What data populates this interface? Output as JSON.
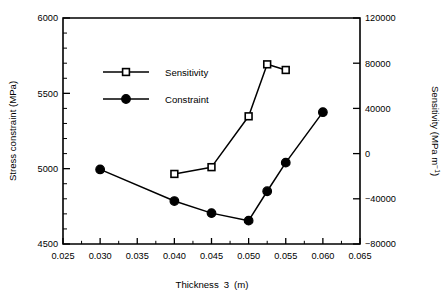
{
  "chart_data": {
    "type": "line",
    "title": "",
    "xlabel": "Thickness  3  (m)",
    "ylabel": "Stress constraint (MPa)",
    "y2label": "Sensitivity (MPa m⁻¹)",
    "xlim": [
      0.025,
      0.065
    ],
    "ylim": [
      4500,
      6000
    ],
    "y2lim": [
      -80000,
      120000
    ],
    "grid": false,
    "legend_position": "upper-left-inside",
    "xticks": [
      "0.025",
      "0.030",
      "0.035",
      "0.040",
      "0.045",
      "0.050",
      "0.055",
      "0.060",
      "0.065"
    ],
    "xtick_values": [
      0.025,
      0.03,
      0.035,
      0.04,
      0.045,
      0.05,
      0.055,
      0.06,
      0.065
    ],
    "yticks": [
      "4500",
      "5000",
      "5500",
      "6000"
    ],
    "ytick_values": [
      4500,
      5000,
      5500,
      6000
    ],
    "y2ticks": [
      "-80000",
      "-40000",
      "0",
      "40000",
      "80000",
      "120000"
    ],
    "y2tick_values": [
      -80000,
      -40000,
      0,
      40000,
      80000,
      120000
    ],
    "series": [
      {
        "name": "Sensitivity",
        "axis": "right",
        "marker": "open-square",
        "x": [
          0.04,
          0.045,
          0.05,
          0.0525,
          0.055
        ],
        "values": [
          -18000,
          -12000,
          33000,
          79000,
          74000
        ]
      },
      {
        "name": "Constraint",
        "axis": "left",
        "marker": "filled-circle",
        "x": [
          0.03,
          0.04,
          0.045,
          0.05,
          0.0525,
          0.055,
          0.06
        ],
        "values": [
          4995,
          4785,
          4705,
          4655,
          4850,
          5040,
          5375
        ]
      }
    ],
    "legend": [
      {
        "label": "Sensitivity",
        "marker": "open-square"
      },
      {
        "label": "Constraint",
        "marker": "filled-circle"
      }
    ],
    "colors": {
      "ink": "#000000",
      "background": "#ffffff"
    }
  },
  "axis_titles": {
    "left": "Stress constraint (MPa)",
    "bottom_part1": "Thickness",
    "bottom_part2": "3",
    "bottom_part3": "(m)",
    "right_part1": "Sensitivity (MPa m",
    "right_sup": "−1",
    "right_part2": ")"
  }
}
